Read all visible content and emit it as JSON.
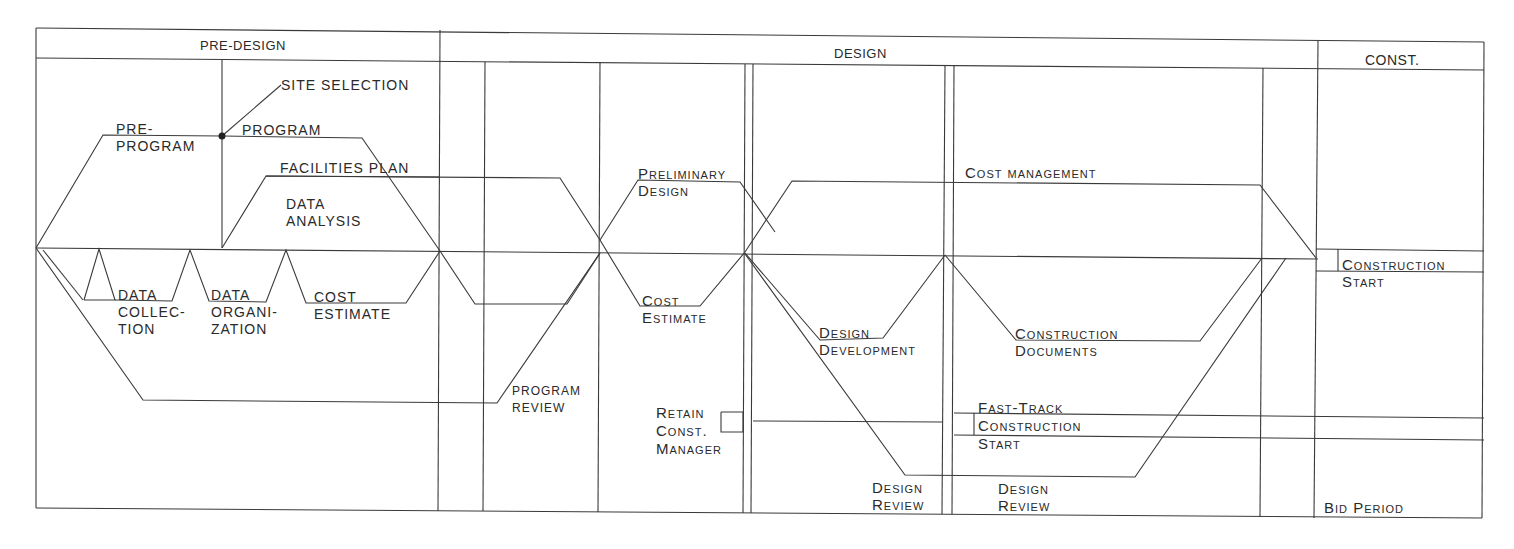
{
  "phases": {
    "pre_design": "PRE-DESIGN",
    "design": "DESIGN",
    "construction": "CONST."
  },
  "pre_design_labels": {
    "site_selection": "SITE SELECTION",
    "pre_program": "PRE-\nPROGRAM",
    "program": "PROGRAM",
    "facilities_plan": "FACILITIES PLAN",
    "data_analysis": "DATA\nANALYSIS",
    "data_collection": "DATA\nCOLLEC-\nTION",
    "data_organization": "DATA\nORGANI-\nZATION",
    "cost_estimate": "COST\nESTIMATE"
  },
  "design_labels": {
    "program_review": "PROGRAM\nREVIEW",
    "preliminary_design": "Preliminary\nDesign",
    "cost_estimate": "Cost\nEstimate",
    "retain_const_manager": "Retain\nConst.\nManager",
    "cost_management": "Cost management",
    "design_development": "Design\nDevelopment",
    "construction_documents": "Construction\nDocuments",
    "fast_track_construction_start": "Fast-Track\nConstruction\nStart",
    "design_review_1": "Design\nReview",
    "design_review_2": "Design\nReview"
  },
  "construction_labels": {
    "construction_start": "Construction\nStart",
    "bid_period": "Bid Period"
  },
  "colors": {
    "line": "#3a3a3a",
    "background": "#ffffff",
    "text": "#2a2a2a"
  }
}
